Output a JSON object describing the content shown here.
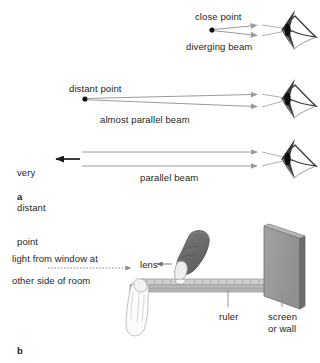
{
  "figure": {
    "panels": [
      {
        "letter": "a",
        "name": "beams-entering-eye",
        "rows": [
          {
            "source_label": "close point",
            "beam_label": "diverging beam",
            "beam_type": "diverging"
          },
          {
            "source_label": "distant point",
            "beam_label": "almost parallel beam",
            "beam_type": "almost-parallel"
          },
          {
            "source_label": "very\ndistant\npoint",
            "beam_label": "parallel beam",
            "beam_type": "parallel"
          }
        ]
      },
      {
        "letter": "b",
        "name": "lens-ruler-screen-experiment",
        "labels": {
          "light_line1": "light from window at",
          "light_line2": "other side of room",
          "lens": "lens",
          "ruler": "ruler",
          "screen_line1": "screen",
          "screen_line2": "or wall"
        }
      }
    ],
    "letters": {
      "a": "a",
      "b": "b"
    },
    "colors": {
      "beam_gray": "#9a9a9a",
      "arrow_black": "#1a1a1a",
      "text": "#231f20",
      "hand_dark": "#6f6f6f",
      "hand_light": "#f2f2f2",
      "ruler_face": "#b3b3b3",
      "ruler_top": "#cfcfcf",
      "screen_face": "#989898",
      "screen_edge": "#6d6d6d",
      "pupil": "#111111",
      "background": "#ffffff"
    }
  },
  "panel_a_labels": {
    "close_point": "close point",
    "diverging_beam": "diverging beam",
    "distant_point": "distant point",
    "almost_parallel_beam": "almost parallel beam",
    "very_distant_point_l1": "very",
    "very_distant_point_l2": "distant",
    "very_distant_point_l3": "point",
    "parallel_beam": "parallel beam"
  },
  "panel_b_labels": {
    "light_from_window_at": "light from window at",
    "other_side_of_room": "other side of room",
    "lens": "lens",
    "ruler": "ruler",
    "screen": "screen",
    "or_wall": "or wall"
  },
  "letters": {
    "a": "a",
    "b": "b"
  }
}
